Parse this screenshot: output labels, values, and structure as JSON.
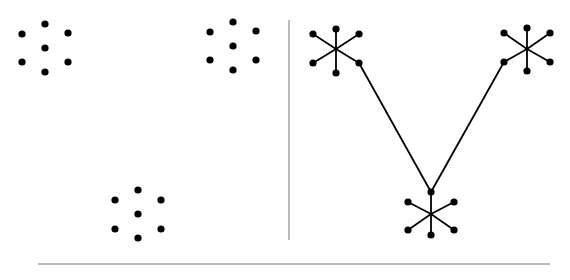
{
  "colors": {
    "ink": "#000000",
    "divider": "#777777",
    "background": "#ffffff"
  },
  "left_panel": {
    "clusters": [
      {
        "name": "cluster-top-left",
        "center": [
          45,
          48
        ],
        "dots": [
          [
            22,
            34
          ],
          [
            45,
            24
          ],
          [
            68,
            33
          ],
          [
            45,
            48
          ],
          [
            22,
            62
          ],
          [
            68,
            62
          ],
          [
            45,
            72
          ]
        ]
      },
      {
        "name": "cluster-top-right",
        "center": [
          233,
          46
        ],
        "dots": [
          [
            210,
            32
          ],
          [
            233,
            22
          ],
          [
            256,
            31
          ],
          [
            233,
            46
          ],
          [
            210,
            60
          ],
          [
            256,
            60
          ],
          [
            233,
            70
          ]
        ]
      },
      {
        "name": "cluster-bottom",
        "center": [
          138,
          214
        ],
        "dots": [
          [
            115,
            200
          ],
          [
            138,
            190
          ],
          [
            161,
            200
          ],
          [
            138,
            214
          ],
          [
            115,
            229
          ],
          [
            161,
            229
          ],
          [
            138,
            238
          ]
        ]
      }
    ]
  },
  "right_panel": {
    "stars": [
      {
        "name": "star-top-left",
        "center": [
          336,
          49
        ],
        "dots": [
          [
            313,
            34
          ],
          [
            336,
            29
          ],
          [
            359,
            34
          ],
          [
            313,
            63
          ],
          [
            336,
            73
          ],
          [
            359,
            63
          ]
        ]
      },
      {
        "name": "star-top-right",
        "center": [
          527,
          49
        ],
        "dots": [
          [
            504,
            33
          ],
          [
            527,
            28
          ],
          [
            550,
            33
          ],
          [
            504,
            62
          ],
          [
            527,
            71
          ],
          [
            550,
            62
          ]
        ]
      },
      {
        "name": "star-bottom",
        "center": [
          431,
          214
        ],
        "dots": [
          [
            408,
            202
          ],
          [
            431,
            192
          ],
          [
            454,
            202
          ],
          [
            408,
            230
          ],
          [
            431,
            235
          ],
          [
            454,
            230
          ]
        ]
      }
    ],
    "connections": [
      {
        "from": [
          359,
          63
        ],
        "to": [
          431,
          192
        ]
      },
      {
        "from": [
          504,
          62
        ],
        "to": [
          431,
          192
        ]
      }
    ]
  },
  "dividers": {
    "vertical": {
      "x": 289,
      "y1": 20,
      "y2": 240
    },
    "horizontal": {
      "y": 264,
      "x1": 38,
      "x2": 550
    }
  }
}
